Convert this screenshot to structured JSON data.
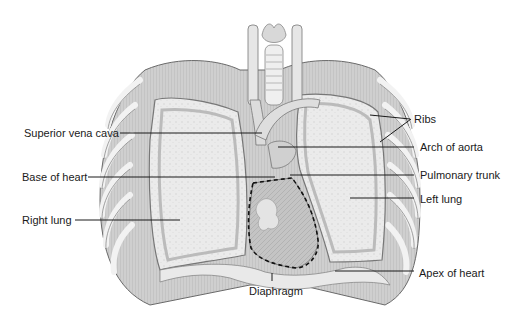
{
  "figure": {
    "labels": {
      "superior_vena_cava": "Superior vena cava",
      "base_of_heart": "Base of heart",
      "right_lung": "Right lung",
      "ribs": "Ribs",
      "arch_of_aorta": "Arch of aorta",
      "pulmonary_trunk": "Pulmonary trunk",
      "left_lung": "Left lung",
      "apex_of_heart": "Apex of heart",
      "diaphragm": "Diaphragm"
    },
    "colors": {
      "outline": "#5a5a5a",
      "rib_fill": "#d9d9d9",
      "lung_fill": "#e8e8e8",
      "heart_fill": "#c8c8c8",
      "leader_line": "#1a1a1a"
    }
  }
}
